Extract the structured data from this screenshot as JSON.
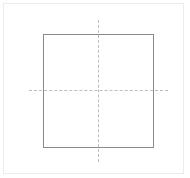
{
  "diagram": {
    "type": "square-with-crosshair",
    "frame": {
      "x": 3,
      "y": 3,
      "width": 181,
      "height": 171,
      "color": "#ececec"
    },
    "square": {
      "x": 43,
      "y": 34,
      "width": 111,
      "height": 114,
      "stroke": "#8a8a8a"
    },
    "crosshair": {
      "center": {
        "x": 98,
        "y": 90
      },
      "horizontal": {
        "x1": 29,
        "x2": 168,
        "y": 90,
        "style": "dashed",
        "color": "#bdbdbd"
      },
      "vertical": {
        "x": 98,
        "y1": 20,
        "y2": 162,
        "style": "dashed",
        "color": "#bdbdbd"
      }
    }
  }
}
